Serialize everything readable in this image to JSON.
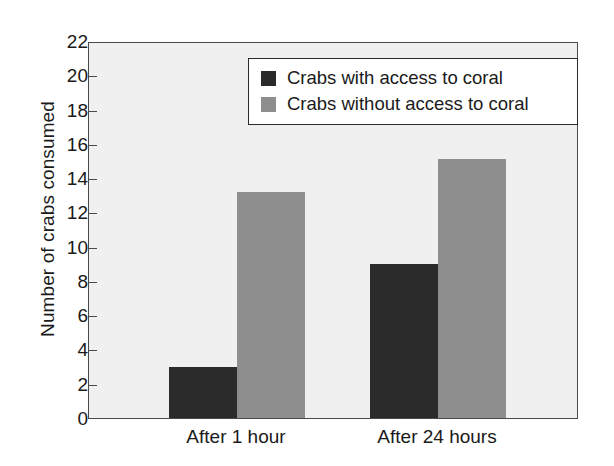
{
  "chart_data": {
    "type": "bar",
    "title": "",
    "xlabel": "",
    "ylabel": "Number of crabs consumed",
    "categories": [
      "After 1 hour",
      "After 24 hours"
    ],
    "series": [
      {
        "name": "Crabs with access to coral",
        "color": "#2b2b2b",
        "values": [
          3,
          9
        ]
      },
      {
        "name": "Crabs without access to coral",
        "color": "#8e8e8e",
        "values": [
          13.2,
          15.1
        ]
      }
    ],
    "ylim": [
      0,
      22
    ],
    "ytick_step": 2,
    "yticks": [
      0,
      2,
      4,
      6,
      8,
      10,
      12,
      14,
      16,
      18,
      20,
      22
    ],
    "ytick_labels": [
      "0",
      "2",
      "4",
      "6",
      "8",
      "10",
      "12",
      "14",
      "16",
      "18",
      "20",
      "22"
    ],
    "grid": false,
    "legend_position": "top-right",
    "plot_background": "#f0f0f0",
    "axis_color": "#4a4a4a"
  }
}
